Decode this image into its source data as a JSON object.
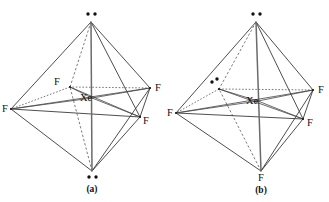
{
  "figure": {
    "type": "molecular-geometry-diagram",
    "background_color": "#ffffff",
    "line_color": "#3a3a3a",
    "structures": [
      {
        "id": "a",
        "caption": "(a)",
        "name": "XeF4 square planar with two axial lone pairs",
        "center_atom": "Xe",
        "vertices": [
          {
            "position": "top-axial",
            "label": "",
            "lone_pair": true,
            "dots": 2
          },
          {
            "position": "bottom-axial",
            "label": "",
            "lone_pair": true,
            "dots": 2
          },
          {
            "position": "equatorial-back-left",
            "label": "F",
            "lone_pair": false
          },
          {
            "position": "equatorial-back-right",
            "label": "F",
            "lone_pair": false
          },
          {
            "position": "equatorial-front-left",
            "label": "F",
            "lone_pair": false
          },
          {
            "position": "equatorial-front-right",
            "label": "F",
            "lone_pair": false
          }
        ]
      },
      {
        "id": "b",
        "caption": "(b)",
        "name": "XeF4 with one equatorial and one axial lone pair",
        "center_atom": "Xe",
        "vertices": [
          {
            "position": "top-axial",
            "label": "",
            "lone_pair": true,
            "dots": 2
          },
          {
            "position": "bottom-axial",
            "label": "F",
            "lone_pair": false
          },
          {
            "position": "equatorial-back-left",
            "label": "",
            "lone_pair": true,
            "dots": 2
          },
          {
            "position": "equatorial-back-right",
            "label": "F",
            "lone_pair": false
          },
          {
            "position": "equatorial-front-left",
            "label": "F",
            "lone_pair": false
          },
          {
            "position": "equatorial-front-right",
            "label": "F",
            "lone_pair": false
          }
        ]
      }
    ]
  },
  "labels": {
    "center_a": "Xe",
    "center_b": "Xe",
    "caption_a": "(a)",
    "caption_b": "(b)",
    "a_f_back_left": "F",
    "a_f_back_right": "F",
    "a_f_front_left": "F",
    "a_f_front_right": "F",
    "b_f_back_right": "F",
    "b_f_front_left": "F",
    "b_f_front_right": "F",
    "b_f_bottom": "F"
  }
}
